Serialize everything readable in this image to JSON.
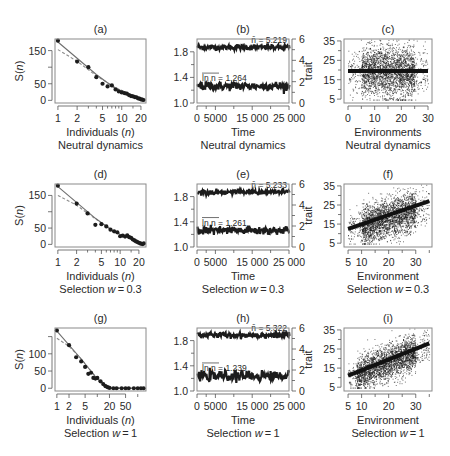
{
  "figure": {
    "width": 450,
    "height": 456,
    "background": "#ffffff",
    "colors": {
      "frame": "#8a8a8a",
      "axis": "#555555",
      "points": "#1c1c1c",
      "fit_solid": "#6e6e6e",
      "fit_dashed": "#8c8c8c",
      "text": "#2a2a2a"
    }
  },
  "chart_data": [
    {
      "id": "a",
      "label": "(a)",
      "type": "scatter",
      "row_caption": "Neutral dynamics",
      "xlabel": "Individuals (n)",
      "ylabel": "S(n)",
      "xscale": "log",
      "xlim": [
        0.9,
        24
      ],
      "ylim": [
        -8,
        185
      ],
      "xticks": [
        1,
        2,
        5,
        10,
        20
      ],
      "xtick_labels": [
        "1",
        "2",
        "5",
        "10",
        "20"
      ],
      "yticks": [
        0,
        50,
        100,
        150
      ],
      "ytick_labels": [
        "0",
        "50",
        "",
        "150"
      ],
      "points": {
        "x": [
          1,
          2,
          3,
          4,
          5,
          6,
          7,
          8,
          9,
          10,
          11,
          12,
          13,
          14,
          15,
          16,
          17,
          18,
          19,
          20,
          21,
          22
        ],
        "y": [
          180,
          117,
          100,
          70,
          50,
          42,
          45,
          33,
          27,
          24,
          22,
          20,
          16,
          13,
          12,
          10,
          9,
          6,
          5,
          3,
          2,
          1
        ]
      },
      "fit_solid": {
        "x": [
          1,
          4,
          8,
          22
        ],
        "y": [
          176,
          78,
          35,
          2
        ]
      },
      "fit_dashed": {
        "x": [
          1,
          2,
          4,
          8,
          22
        ],
        "y": [
          153,
          118,
          74,
          38,
          2
        ]
      }
    },
    {
      "id": "b",
      "label": "(b)",
      "type": "line",
      "row_caption": "Neutral dynamics",
      "xlabel": "Time",
      "ylabel_left": "",
      "ylabel_right": "",
      "xlim": [
        0,
        25000
      ],
      "ylim_left": [
        1.0,
        2.0
      ],
      "ylim_right": [
        0,
        6
      ],
      "xticks": [
        0,
        5000,
        15000,
        25000
      ],
      "xtick_labels": [
        "0",
        "5000",
        "15 000",
        "25 000"
      ],
      "xminor": [
        2500,
        10000,
        20000
      ],
      "yticks_left": [
        1.0,
        1.4,
        1.8
      ],
      "ytick_labels_left": [
        "1.0",
        "1.4",
        "1.8"
      ],
      "yminor_left": [
        1.2,
        1.6
      ],
      "yticks_right": [
        0,
        2,
        4,
        6
      ],
      "ytick_labels_right": [
        "0",
        "2",
        "4",
        "6"
      ],
      "yminor_right": [
        1,
        3,
        5
      ],
      "series": [
        {
          "name": "mean n (right axis)",
          "mean": 5.219,
          "noise": 0.12,
          "axis": "right",
          "annotation": "n̄ = 5.219"
        },
        {
          "name": "mean ln n (left axis)",
          "mean": 1.264,
          "noise": 0.035,
          "axis": "left",
          "annotation": "ln n = 1.264"
        }
      ]
    },
    {
      "id": "c",
      "label": "(c)",
      "type": "scatter",
      "row_caption": "Neutral dynamics",
      "xlabel": "Environments",
      "ylabel": "trait",
      "xlim": [
        -1.5,
        31.5
      ],
      "ylim": [
        3,
        36
      ],
      "xticks": [
        0,
        10,
        20,
        30
      ],
      "xtick_labels": [
        "0",
        "10",
        "20",
        "30"
      ],
      "xminor": [
        5,
        15,
        25
      ],
      "yticks": [
        5,
        15,
        25,
        35
      ],
      "ytick_labels": [
        "5",
        "15",
        "25",
        "35"
      ],
      "yminor": [
        10,
        20,
        30
      ],
      "cloud": {
        "n": 2600,
        "x_range": [
          0,
          30
        ],
        "x_core": [
          5,
          25
        ],
        "y_center": 19,
        "y_spread": 6.5,
        "slope": 0
      },
      "fit_line": {
        "x": [
          0,
          30
        ],
        "y": [
          19.5,
          19.5
        ]
      }
    },
    {
      "id": "d",
      "label": "(d)",
      "type": "scatter",
      "row_caption": "Selection w = 0.3",
      "xlabel": "Individuals (n)",
      "ylabel": "S(n)",
      "xscale": "log",
      "xlim": [
        0.9,
        26
      ],
      "ylim": [
        -8,
        185
      ],
      "xticks": [
        1,
        2,
        5,
        10,
        20
      ],
      "xtick_labels": [
        "1",
        "2",
        "5",
        "10",
        "20"
      ],
      "yticks": [
        0,
        50,
        100,
        150
      ],
      "ytick_labels": [
        "0",
        "50",
        "",
        "150"
      ],
      "points": {
        "x": [
          1,
          2,
          3,
          4,
          5,
          6,
          7,
          8,
          9,
          10,
          11,
          12,
          13,
          14,
          15,
          16,
          17,
          18,
          19,
          20,
          21,
          22,
          23,
          24
        ],
        "y": [
          180,
          125,
          95,
          60,
          62,
          55,
          45,
          40,
          37,
          25,
          27,
          24,
          28,
          22,
          20,
          15,
          12,
          9,
          7,
          5,
          3,
          2,
          1,
          3
        ]
      },
      "fit_solid": {
        "x": [
          1,
          4,
          8,
          24
        ],
        "y": [
          177,
          80,
          38,
          1
        ]
      },
      "fit_dashed": {
        "x": [
          1,
          2,
          4,
          8,
          24
        ],
        "y": [
          150,
          120,
          78,
          40,
          1
        ]
      }
    },
    {
      "id": "e",
      "label": "(e)",
      "type": "line",
      "row_caption": "Selection w = 0.3",
      "xlabel": "Time",
      "xlim": [
        0,
        25000
      ],
      "ylim_left": [
        1.0,
        2.0
      ],
      "ylim_right": [
        0,
        6
      ],
      "xticks": [
        0,
        5000,
        15000,
        25000
      ],
      "xtick_labels": [
        "0",
        "5000",
        "15 000",
        "25 000"
      ],
      "xminor": [
        2500,
        10000,
        20000
      ],
      "yticks_left": [
        1.0,
        1.4,
        1.8
      ],
      "ytick_labels_left": [
        "1.0",
        "1.4",
        "1.8"
      ],
      "yminor_left": [
        1.2,
        1.6
      ],
      "yticks_right": [
        0,
        2,
        4,
        6
      ],
      "ytick_labels_right": [
        "0",
        "2",
        "4",
        "6"
      ],
      "yminor_right": [
        1,
        3,
        5
      ],
      "series": [
        {
          "name": "mean n (right axis)",
          "mean": 5.233,
          "noise": 0.12,
          "axis": "right",
          "annotation": "n̄ = 5.233"
        },
        {
          "name": "mean ln n (left axis)",
          "mean": 1.261,
          "noise": 0.035,
          "axis": "left",
          "annotation": "ln n = 1.261"
        }
      ]
    },
    {
      "id": "f",
      "label": "(f)",
      "type": "scatter",
      "row_caption": "Selection w = 0.3",
      "xlabel": "Environment",
      "ylabel": "trait",
      "xlim": [
        3.5,
        36
      ],
      "ylim": [
        3,
        36
      ],
      "xticks": [
        5,
        10,
        20,
        30
      ],
      "xtick_labels": [
        "5",
        "10",
        "20",
        "30"
      ],
      "xminor": [
        15,
        25,
        35
      ],
      "yticks": [
        5,
        15,
        25,
        35
      ],
      "ytick_labels": [
        "5",
        "15",
        "25",
        "35"
      ],
      "yminor": [
        10,
        20,
        30
      ],
      "cloud": {
        "n": 2600,
        "x_range": [
          5,
          35
        ],
        "x_core": [
          10,
          30
        ],
        "y_center": 18,
        "y_spread": 5,
        "slope": 0.45
      },
      "fit_line": {
        "x": [
          5,
          35
        ],
        "y": [
          12.5,
          27
        ]
      }
    },
    {
      "id": "g",
      "label": "(g)",
      "type": "scatter",
      "row_caption": "Selection w = 1",
      "xlabel": "Individuals (n)",
      "ylabel": "S(n)",
      "xscale": "log",
      "xlim": [
        0.9,
        160
      ],
      "ylim": [
        -8,
        175
      ],
      "xticks": [
        1,
        2,
        5,
        20,
        50
      ],
      "xtick_labels": [
        "1",
        "2",
        "5",
        "20",
        "50"
      ],
      "xminor": [
        10,
        100
      ],
      "yticks": [
        0,
        50,
        100,
        150
      ],
      "ytick_labels": [
        "0",
        "50",
        "100",
        ""
      ],
      "points": {
        "x": [
          1,
          2,
          3,
          4,
          5,
          6,
          7,
          8,
          9,
          10,
          12,
          14,
          16,
          18,
          20,
          25,
          30,
          40,
          50,
          60,
          80,
          100,
          120,
          140
        ],
        "y": [
          168,
          125,
          90,
          78,
          62,
          42,
          45,
          30,
          28,
          30,
          20,
          12,
          6,
          3,
          1,
          0,
          0,
          0,
          0,
          0,
          0,
          0,
          0,
          0
        ]
      },
      "fit_solid": {
        "x": [
          1,
          4,
          10,
          20,
          150
        ],
        "y": [
          166,
          85,
          27,
          1,
          0
        ]
      },
      "fit_dashed": {
        "x": [
          1,
          2,
          4,
          10,
          20,
          150
        ],
        "y": [
          145,
          122,
          85,
          28,
          1,
          0
        ]
      }
    },
    {
      "id": "h",
      "label": "(h)",
      "type": "line",
      "row_caption": "Selection w = 1",
      "xlabel": "Time",
      "xlim": [
        0,
        25000
      ],
      "ylim_left": [
        1.0,
        2.0
      ],
      "ylim_right": [
        0,
        6
      ],
      "xticks": [
        0,
        5000,
        15000,
        25000
      ],
      "xtick_labels": [
        "0",
        "5000",
        "15 000",
        "25 000"
      ],
      "xminor": [
        2500,
        10000,
        20000
      ],
      "yticks_left": [
        1.0,
        1.4,
        1.8
      ],
      "ytick_labels_left": [
        "1.0",
        "1.4",
        "1.8"
      ],
      "yminor_left": [
        1.2,
        1.6
      ],
      "yticks_right": [
        0,
        2,
        4,
        6
      ],
      "ytick_labels_right": [
        "0",
        "2",
        "4",
        "6"
      ],
      "yminor_right": [
        1,
        3,
        5
      ],
      "series": [
        {
          "name": "mean n (right axis)",
          "mean": 5.322,
          "noise": 0.14,
          "axis": "right",
          "annotation": "n̄ = 5.322"
        },
        {
          "name": "mean ln n (left axis)",
          "mean": 1.239,
          "noise": 0.04,
          "axis": "left",
          "annotation": "ln n = 1.239"
        }
      ]
    },
    {
      "id": "i",
      "label": "(i)",
      "type": "scatter",
      "row_caption": "Selection w = 1",
      "xlabel": "Environment",
      "ylabel": "trait",
      "xlim": [
        3.5,
        36
      ],
      "ylim": [
        3,
        36
      ],
      "xticks": [
        5,
        10,
        20,
        30
      ],
      "xtick_labels": [
        "5",
        "10",
        "20",
        "30"
      ],
      "xminor": [
        15,
        25,
        35
      ],
      "yticks": [
        5,
        15,
        25,
        35
      ],
      "ytick_labels": [
        "5",
        "15",
        "25",
        "35"
      ],
      "yminor": [
        10,
        20,
        30
      ],
      "cloud": {
        "n": 2600,
        "x_range": [
          5,
          35
        ],
        "x_core": [
          8,
          30
        ],
        "y_center": 18,
        "y_spread": 4.5,
        "slope": 0.55
      },
      "fit_line": {
        "x": [
          5,
          35
        ],
        "y": [
          11,
          28
        ]
      }
    }
  ],
  "layout": {
    "columns_x": [
      55,
      197,
      344
    ],
    "plot_width": [
      91,
      92,
      88
    ],
    "rows_y": [
      39,
      184,
      328
    ],
    "plot_height": [
      64,
      63,
      63
    ]
  }
}
